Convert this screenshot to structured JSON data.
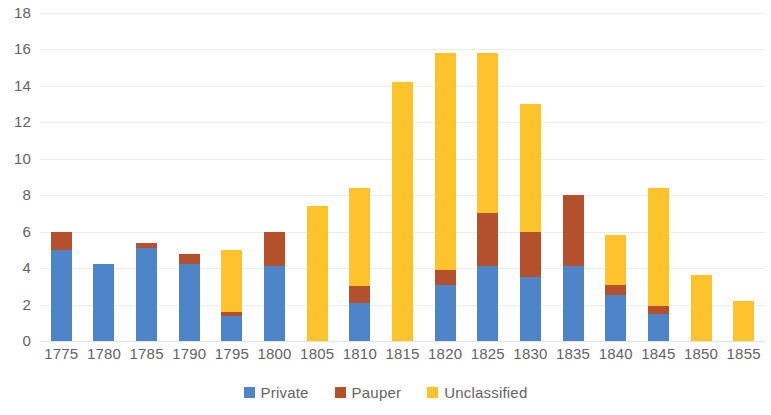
{
  "chart_data": {
    "type": "bar",
    "stacked": true,
    "title": "",
    "subtitle": "",
    "xlabel": "",
    "ylabel": "",
    "grid": true,
    "legend_position": "bottom",
    "ylim": [
      0,
      18
    ],
    "ytick_step": 2,
    "ytick_labels": [
      "0",
      "2",
      "4",
      "6",
      "8",
      "10",
      "12",
      "14",
      "16",
      "18"
    ],
    "categories": [
      "1775",
      "1780",
      "1785",
      "1790",
      "1795",
      "1800",
      "1805",
      "1810",
      "1815",
      "1820",
      "1825",
      "1830",
      "1835",
      "1840",
      "1845",
      "1850",
      "1855"
    ],
    "series": [
      {
        "name": "Private",
        "color": "#4e85c8",
        "values": [
          5.0,
          4.2,
          5.1,
          4.2,
          1.4,
          4.1,
          0.0,
          2.1,
          0.0,
          3.1,
          4.1,
          3.5,
          4.1,
          2.5,
          1.5,
          0.0,
          0.0
        ]
      },
      {
        "name": "Pauper",
        "color": "#b5502d",
        "values": [
          1.0,
          0.0,
          0.3,
          0.6,
          0.2,
          1.9,
          0.0,
          0.9,
          0.0,
          0.8,
          2.9,
          2.5,
          3.9,
          0.6,
          0.4,
          0.0,
          0.0
        ]
      },
      {
        "name": "Unclassified",
        "color": "#fcc32c",
        "values": [
          0.0,
          0.0,
          0.0,
          0.0,
          3.4,
          0.0,
          7.4,
          5.4,
          14.2,
          11.9,
          8.8,
          7.0,
          0.0,
          2.7,
          6.5,
          3.6,
          2.2
        ]
      }
    ],
    "totals": [
      6.0,
      4.2,
      5.4,
      4.8,
      5.0,
      6.0,
      7.4,
      8.4,
      14.2,
      15.8,
      15.8,
      13.0,
      8.0,
      5.8,
      8.4,
      3.6,
      2.2
    ]
  },
  "legend": {
    "items": [
      {
        "label": "Private",
        "color": "#4e85c8",
        "swatch": "legend-swatch-private"
      },
      {
        "label": "Pauper",
        "color": "#b5502d",
        "swatch": "legend-swatch-pauper"
      },
      {
        "label": "Unclassified",
        "color": "#fcc32c",
        "swatch": "legend-swatch-unclassified"
      }
    ]
  },
  "colors": {
    "background": "#ffffff",
    "gridline": "#eceded",
    "axis_text": "#636363",
    "private": "#4e85c8",
    "pauper": "#b5502d",
    "unclassified": "#fcc32c"
  }
}
